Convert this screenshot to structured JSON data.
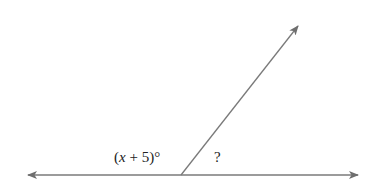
{
  "diagram": {
    "type": "angle-diagram",
    "line_color": "#7a7a7a",
    "text_color": "#222222",
    "horizontal_line": {
      "x1": 28,
      "y1": 175,
      "x2": 358,
      "y2": 175,
      "arrows": "both"
    },
    "ray": {
      "x1": 181,
      "y1": 175,
      "x2": 298,
      "y2": 26,
      "arrow": "end"
    },
    "labels": {
      "left_angle_var": "x",
      "left_angle_rest": " + 5)°",
      "left_angle_open": "(",
      "right_angle": "?"
    }
  }
}
